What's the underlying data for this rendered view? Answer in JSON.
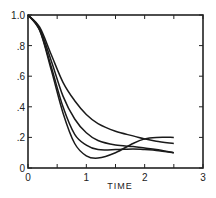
{
  "chart_data": {
    "type": "line",
    "title": "",
    "xlabel": "TIME",
    "ylabel": "",
    "xlim": [
      0,
      3
    ],
    "ylim": [
      0,
      1.0
    ],
    "grid": false,
    "legend": null,
    "x_ticks": [
      0,
      0.5,
      1,
      1.5,
      2,
      2.5,
      3
    ],
    "x_tick_labels": [
      "0",
      "1",
      "2",
      "3"
    ],
    "x_tick_label_values": [
      0,
      1,
      2,
      3
    ],
    "y_ticks": [
      0,
      0.2,
      0.4,
      0.6,
      0.8,
      1.0
    ],
    "y_tick_labels": [
      "0",
      ".2",
      ".4",
      ".6",
      ".8",
      "1.0"
    ],
    "series": [
      {
        "name": "curve-1",
        "x": [
          0,
          0.2,
          0.4,
          0.6,
          0.8,
          1.0,
          1.2,
          1.5,
          1.8,
          2.0,
          2.2,
          2.5
        ],
        "y": [
          1.0,
          0.92,
          0.74,
          0.56,
          0.44,
          0.35,
          0.29,
          0.24,
          0.21,
          0.19,
          0.175,
          0.16
        ]
      },
      {
        "name": "curve-2",
        "x": [
          0,
          0.2,
          0.4,
          0.6,
          0.8,
          1.0,
          1.2,
          1.5,
          1.8,
          2.0,
          2.2,
          2.5
        ],
        "y": [
          1.0,
          0.91,
          0.7,
          0.47,
          0.32,
          0.23,
          0.18,
          0.15,
          0.14,
          0.13,
          0.12,
          0.1
        ]
      },
      {
        "name": "curve-3",
        "x": [
          0,
          0.2,
          0.4,
          0.6,
          0.8,
          1.0,
          1.2,
          1.5,
          1.8,
          2.0,
          2.2,
          2.5
        ],
        "y": [
          1.0,
          0.9,
          0.66,
          0.4,
          0.22,
          0.15,
          0.12,
          0.12,
          0.125,
          0.12,
          0.115,
          0.1
        ]
      },
      {
        "name": "curve-4",
        "x": [
          0,
          0.2,
          0.4,
          0.6,
          0.8,
          1.0,
          1.2,
          1.5,
          1.8,
          2.0,
          2.2,
          2.5
        ],
        "y": [
          1.0,
          0.9,
          0.64,
          0.36,
          0.16,
          0.08,
          0.065,
          0.1,
          0.16,
          0.19,
          0.2,
          0.2
        ]
      }
    ]
  }
}
